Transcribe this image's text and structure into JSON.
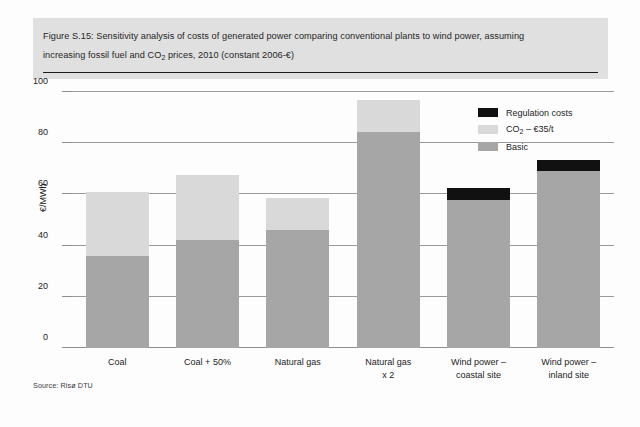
{
  "figure": {
    "title_line_1": "Figure S.15: Sensitivity analysis of costs of generated power comparing conventional plants to wind power, assuming",
    "title_line_2_pre": "increasing fossil fuel and CO",
    "title_line_2_sub": "2",
    "title_line_2_post": " prices, 2010 (constant 2006-€)",
    "source": "Source: Risø DTU"
  },
  "legend": {
    "position": "top-right",
    "items": [
      {
        "label": "Regulation costs",
        "color": "#111111",
        "has_sub": false
      },
      {
        "label_pre": "CO",
        "label_sub": "2",
        "label_post": " – €35/t",
        "label": "CO2 – €35/t",
        "color": "#d9d9d9",
        "has_sub": true
      },
      {
        "label": "Basic",
        "color": "#a6a6a6",
        "has_sub": false
      }
    ]
  },
  "chart_data": {
    "type": "bar",
    "title": "Figure S.15: Sensitivity analysis of costs of generated power comparing conventional plants to wind power, assuming increasing fossil fuel and CO2 prices, 2010 (constant 2006-€)",
    "xlabel": "",
    "ylabel": "€/MWh",
    "ylim": [
      0,
      100
    ],
    "yticks": [
      0,
      20,
      40,
      60,
      80,
      100
    ],
    "ytick_labels": [
      "0",
      "20",
      "40",
      "60",
      "80",
      "100"
    ],
    "grid": true,
    "stacked": true,
    "categories": [
      "Coal",
      "Coal + 50%",
      "Natural gas",
      "Natural gas\nx 2",
      "Wind power –\ncoastal site",
      "Wind power –\ninland site"
    ],
    "series": [
      {
        "name": "Basic",
        "color": "#a6a6a6",
        "values": [
          36.0,
          42.0,
          46.0,
          84.5,
          58.0,
          69.0
        ]
      },
      {
        "name": "CO2 – €35/t",
        "color": "#d9d9d9",
        "values": [
          25.0,
          25.5,
          12.5,
          12.5,
          0.0,
          0.0
        ]
      },
      {
        "name": "Regulation costs",
        "color": "#111111",
        "values": [
          0.0,
          0.0,
          0.0,
          0.0,
          4.5,
          4.5
        ]
      }
    ],
    "totals": [
      61.0,
      67.5,
      58.5,
      97.0,
      62.5,
      73.5
    ]
  }
}
